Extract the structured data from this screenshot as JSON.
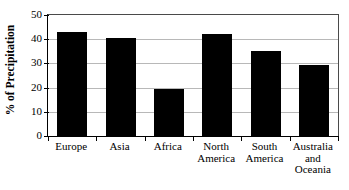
{
  "chart_data": {
    "type": "bar",
    "title": "",
    "xlabel": "",
    "ylabel": "% of Precipitation",
    "categories": [
      "Europe",
      "Asia",
      "Africa",
      "North America",
      "South America",
      "Australia and Oceania"
    ],
    "category_lines": [
      [
        "Europe"
      ],
      [
        "Asia"
      ],
      [
        "Africa"
      ],
      [
        "North",
        "America"
      ],
      [
        "South",
        "America"
      ],
      [
        "Australia",
        "and",
        "Oceania"
      ]
    ],
    "values": [
      43,
      40.5,
      19.5,
      42,
      35,
      29.5
    ],
    "ylim": [
      0,
      50
    ],
    "yticks": [
      0,
      10,
      20,
      30,
      40,
      50
    ],
    "ytick_labels": [
      "0",
      "10",
      "20",
      "30",
      "40",
      "50"
    ],
    "grid": true,
    "grid_axis": "y",
    "legend": "none",
    "bar_color": "#000000",
    "grid_color": "#b8b8b8",
    "axis_color": "#000000"
  }
}
